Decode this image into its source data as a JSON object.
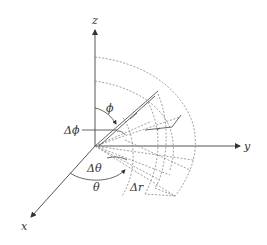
{
  "diagram": {
    "axes": {
      "x": {
        "label": "x"
      },
      "y": {
        "label": "y"
      },
      "z": {
        "label": "z"
      }
    },
    "labels": {
      "phi": "ϕ",
      "delta_phi": "Δϕ",
      "theta": "θ",
      "delta_theta": "Δθ",
      "delta_r": "Δr"
    },
    "colors": {
      "axis": "#555555",
      "dashed": "#888888",
      "text": "#333333",
      "background": "#ffffff"
    }
  }
}
